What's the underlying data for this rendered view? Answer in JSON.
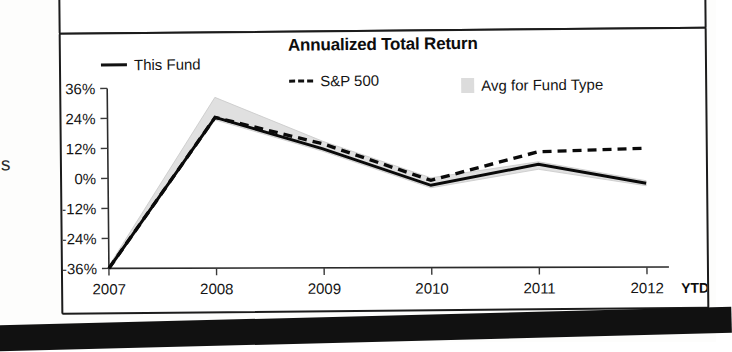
{
  "chart_data": {
    "type": "line",
    "title": "Annualized Total Return",
    "xlabel": "",
    "ylabel": "",
    "grid": false,
    "legend_position": "top",
    "categories": [
      "2007",
      "2008",
      "2009",
      "2010",
      "2011",
      "2012"
    ],
    "x_axis_suffix": "YTD",
    "ytick_labels": [
      "36%",
      "24%",
      "12%",
      "0%",
      "-12%",
      "-24%",
      "-36%"
    ],
    "ytick_values": [
      36,
      24,
      12,
      0,
      -12,
      -24,
      -36
    ],
    "ylim": [
      -36,
      36
    ],
    "series": [
      {
        "name": "This Fund",
        "style": "solid-line",
        "color": "#0a0a0a",
        "values": [
          -36,
          24,
          11,
          -4,
          4,
          -4
        ]
      },
      {
        "name": "S&P 500",
        "style": "dashed-line",
        "color": "#0a0a0a",
        "values": [
          -36,
          24,
          13,
          -2,
          9,
          10
        ]
      },
      {
        "name": "Avg for Fund Type",
        "style": "shaded-band",
        "color": "#e0e0e0",
        "upper": [
          -35,
          32,
          14,
          -1,
          5,
          -3
        ],
        "lower": [
          -36,
          23,
          10,
          -5,
          2,
          -5
        ]
      }
    ]
  },
  "legend": {
    "items": [
      {
        "label": "This Fund",
        "marker": "solid-line-swatch"
      },
      {
        "label": "S&P 500",
        "marker": "dashed-line-swatch"
      },
      {
        "label": "Avg for Fund Type",
        "marker": "gray-band-swatch"
      }
    ]
  },
  "artifacts": {
    "left_cut_text": "s"
  },
  "colors": {
    "ink": "#0a0a0a",
    "band": "#e0e0e0",
    "frame": "#1c1c1c",
    "paper": "#ffffff"
  }
}
